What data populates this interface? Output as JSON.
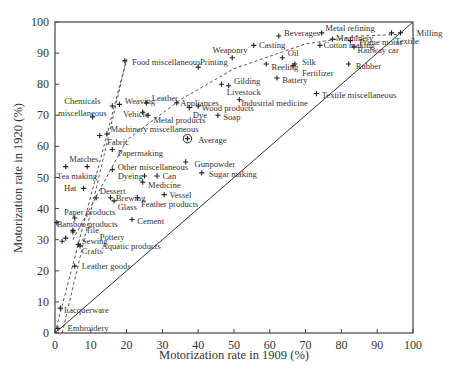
{
  "chart_data": {
    "type": "scatter",
    "title": "",
    "xlabel": "Motorization rate in 1909 (%)",
    "ylabel": "Motorization rate in 1920 (%)",
    "xlim": [
      0,
      100
    ],
    "ylim": [
      0,
      100
    ],
    "xticks": [
      0,
      10,
      20,
      30,
      40,
      50,
      60,
      70,
      80,
      90,
      100
    ],
    "yticks": [
      0,
      10,
      20,
      30,
      40,
      50,
      60,
      70,
      80,
      90,
      100
    ],
    "grid": false,
    "legend": null,
    "reference_lines": [
      {
        "name": "y = x diagonal",
        "style": "solid",
        "points": [
          [
            0,
            0
          ],
          [
            100,
            100
          ]
        ]
      },
      {
        "name": "steep trend (left)",
        "style": "dashed",
        "points": [
          [
            0,
            0
          ],
          [
            20,
            88
          ]
        ]
      },
      {
        "name": "steep trend (right)",
        "style": "dashed",
        "points": [
          [
            2,
            0
          ],
          [
            20,
            88
          ]
        ]
      },
      {
        "name": "shallow trend curve",
        "style": "dashed",
        "points": [
          [
            5,
            30
          ],
          [
            20,
            62
          ],
          [
            35,
            75
          ],
          [
            50,
            85
          ],
          [
            70,
            93
          ],
          [
            85,
            95.5
          ],
          [
            96,
            96
          ]
        ]
      }
    ],
    "points": [
      {
        "label": "Food miscellaneous",
        "x": 19.5,
        "y": 87.5,
        "lx": 21.5,
        "ly": 87.0
      },
      {
        "label": "Chemicals miscellaneous",
        "x": 10.5,
        "y": 69.5,
        "lx": 1.5,
        "ly": 74.5
      },
      {
        "label": "Weaving",
        "x": 18.0,
        "y": 73.5,
        "lx": 19.5,
        "ly": 74.5
      },
      {
        "label": "Weaving2",
        "x": 16.0,
        "y": 73.0,
        "lx": null,
        "ly": null
      },
      {
        "label": "Leather",
        "x": 25.5,
        "y": 74.0,
        "lx": 27.0,
        "ly": 75.5
      },
      {
        "label": "Vehicle",
        "x": 24.5,
        "y": 71.0,
        "lx": 19.0,
        "ly": 70.5
      },
      {
        "label": "Metal products",
        "x": 26.0,
        "y": 70.0,
        "lx": 27.5,
        "ly": 68.5
      },
      {
        "label": "Appliances",
        "x": 34.0,
        "y": 74.0,
        "lx": 35.0,
        "ly": 74.0
      },
      {
        "label": "Dye",
        "x": 37.5,
        "y": 72.5,
        "lx": 38.5,
        "ly": 70.0
      },
      {
        "label": "Wood products",
        "x": 40.0,
        "y": 73.0,
        "lx": 41.0,
        "ly": 72.5
      },
      {
        "label": "Soap",
        "x": 45.5,
        "y": 70.0,
        "lx": 47.0,
        "ly": 69.5
      },
      {
        "label": "Industrial medicine",
        "x": 51.5,
        "y": 75.0,
        "lx": 52.0,
        "ly": 74.0
      },
      {
        "label": "Gilding",
        "x": 46.5,
        "y": 80.0,
        "lx": 50.0,
        "ly": 81.0
      },
      {
        "label": "Livestock",
        "x": 48.5,
        "y": 79.5,
        "lx": 48.0,
        "ly": 77.5
      },
      {
        "label": "Printing",
        "x": 40.0,
        "y": 85.5,
        "lx": 40.5,
        "ly": 87.0
      },
      {
        "label": "Weaponry",
        "x": 49.5,
        "y": 88.5,
        "lx": 44.0,
        "ly": 91.0
      },
      {
        "label": "Casting",
        "x": 55.5,
        "y": 92.5,
        "lx": 57.0,
        "ly": 92.5
      },
      {
        "label": "Beverages",
        "x": 62.5,
        "y": 95.5,
        "lx": 64.0,
        "ly": 96.5
      },
      {
        "label": "Metal refining",
        "x": 74.5,
        "y": 96.5,
        "lx": 75.5,
        "ly": 98.0
      },
      {
        "label": "Machinery",
        "x": 77.5,
        "y": 94.5,
        "lx": 78.5,
        "ly": 95.0
      },
      {
        "label": "Cotton making",
        "x": 74.0,
        "y": 92.5,
        "lx": 75.0,
        "ly": 92.5
      },
      {
        "label": "Prime motor",
        "x": 82.5,
        "y": 94.0,
        "lx": 85.0,
        "ly": 93.5
      },
      {
        "label": "Railway car",
        "x": 83.5,
        "y": 92.0,
        "lx": 84.5,
        "ly": 91.0
      },
      {
        "label": "Milling",
        "x": 96.5,
        "y": 96.5,
        "lx": 101.0,
        "ly": 96.5
      },
      {
        "label": "Textile",
        "x": 94.0,
        "y": 96.5,
        "lx": 95.0,
        "ly": 94.0
      },
      {
        "label": "Oil",
        "x": 63.5,
        "y": 88.5,
        "lx": 65.0,
        "ly": 90.0
      },
      {
        "label": "Reeling",
        "x": 59.0,
        "y": 86.5,
        "lx": 60.5,
        "ly": 85.5
      },
      {
        "label": "Silk",
        "x": 67.0,
        "y": 86.5,
        "lx": 69.0,
        "ly": 87.0
      },
      {
        "label": "Fertilizer",
        "x": 66.5,
        "y": 86.0,
        "lx": 69.0,
        "ly": 83.5
      },
      {
        "label": "Battery",
        "x": 62.0,
        "y": 82.0,
        "lx": 63.5,
        "ly": 81.5
      },
      {
        "label": "Rubber",
        "x": 82.0,
        "y": 86.5,
        "lx": 84.0,
        "ly": 86.0
      },
      {
        "label": "Textile miscellaneous",
        "x": 73.0,
        "y": 77.0,
        "lx": 74.5,
        "ly": 76.5
      },
      {
        "label": "Machinery miscellaneous",
        "x": 14.5,
        "y": 64.0,
        "lx": 15.5,
        "ly": 65.5
      },
      {
        "label": "Fabric",
        "x": 12.5,
        "y": 63.5,
        "lx": 14.5,
        "ly": 61.5
      },
      {
        "label": "Papermaking",
        "x": 16.0,
        "y": 59.0,
        "lx": 17.5,
        "ly": 58.0
      },
      {
        "label": "Average",
        "x": 37.0,
        "y": 62.5,
        "lx": 40.0,
        "ly": 62.0
      },
      {
        "label": "Matches",
        "x": 9.0,
        "y": 53.5,
        "lx": 4.0,
        "ly": 56.0
      },
      {
        "label": "Tea making",
        "x": 3.0,
        "y": 53.5,
        "lx": 0.5,
        "ly": 50.5
      },
      {
        "label": "Other miscellaneous",
        "x": 16.0,
        "y": 52.5,
        "lx": 17.5,
        "ly": 53.5
      },
      {
        "label": "Gunpowder",
        "x": 36.5,
        "y": 55.0,
        "lx": 39.0,
        "ly": 54.5
      },
      {
        "label": "Sugar making",
        "x": 41.0,
        "y": 51.5,
        "lx": 43.0,
        "ly": 51.0
      },
      {
        "label": "Dyeing",
        "x": 25.0,
        "y": 50.5,
        "lx": 17.5,
        "ly": 50.5
      },
      {
        "label": "Can",
        "x": 28.5,
        "y": 50.5,
        "lx": 30.0,
        "ly": 50.5
      },
      {
        "label": "Medicine",
        "x": 24.5,
        "y": 48.5,
        "lx": 26.0,
        "ly": 47.5
      },
      {
        "label": "Hat",
        "x": 8.0,
        "y": 46.5,
        "lx": 2.5,
        "ly": 46.5
      },
      {
        "label": "Dessert",
        "x": 11.5,
        "y": 43.5,
        "lx": 12.5,
        "ly": 45.5
      },
      {
        "label": "Brewing",
        "x": 15.5,
        "y": 43.5,
        "lx": 17.0,
        "ly": 43.5
      },
      {
        "label": "Glass",
        "x": 16.5,
        "y": 42.5,
        "lx": 17.5,
        "ly": 40.5
      },
      {
        "label": "Feather products",
        "x": 23.0,
        "y": 43.5,
        "lx": 24.0,
        "ly": 41.5
      },
      {
        "label": "Vessel",
        "x": 30.5,
        "y": 44.5,
        "lx": 32.0,
        "ly": 44.5
      },
      {
        "label": "Cement",
        "x": 21.5,
        "y": 36.5,
        "lx": 23.0,
        "ly": 36.0
      },
      {
        "label": "Paper products",
        "x": 5.5,
        "y": 37.0,
        "lx": 2.5,
        "ly": 39.0
      },
      {
        "label": "Bamboo products",
        "x": 0.5,
        "y": 35.5,
        "lx": 0.5,
        "ly": 35.0
      },
      {
        "label": "Tile",
        "x": 5.0,
        "y": 33.0,
        "lx": 8.5,
        "ly": 33.0
      },
      {
        "label": "Pottery",
        "x": 5.0,
        "y": 32.5,
        "lx": 12.5,
        "ly": 31.0
      },
      {
        "label": "Sewing",
        "x": 3.0,
        "y": 30.5,
        "lx": 7.5,
        "ly": 29.5
      },
      {
        "label": "Sewing2",
        "x": 2.0,
        "y": 29.5,
        "lx": null,
        "ly": null
      },
      {
        "label": "Aquatic products",
        "x": 6.5,
        "y": 28.5,
        "lx": 13.0,
        "ly": 28.0
      },
      {
        "label": "Crafts",
        "x": 7.0,
        "y": 28.0,
        "lx": 7.5,
        "ly": 26.5
      },
      {
        "label": "Leather goods",
        "x": 5.5,
        "y": 21.5,
        "lx": 7.5,
        "ly": 21.5
      },
      {
        "label": "Lacquerware",
        "x": 1.5,
        "y": 8.0,
        "lx": 2.5,
        "ly": 7.5
      },
      {
        "label": "Embroidery",
        "x": 0.8,
        "y": 1.5,
        "lx": 3.5,
        "ly": 1.5
      }
    ]
  },
  "labels": {
    "x_axis_title": "Motorization rate in 1909 (%)",
    "y_axis_title": "Motorization rate in 1920 (%)",
    "x_ticks": [
      "0",
      "10",
      "20",
      "30",
      "40",
      "50",
      "60",
      "70",
      "80",
      "90",
      "100"
    ],
    "y_ticks": [
      "0",
      "10",
      "20",
      "30",
      "40",
      "50",
      "60",
      "70",
      "80",
      "90",
      "100"
    ]
  },
  "colors": {
    "marker": "#222222",
    "axis": "#444444",
    "text": "#333333",
    "background": "#ffffff"
  }
}
